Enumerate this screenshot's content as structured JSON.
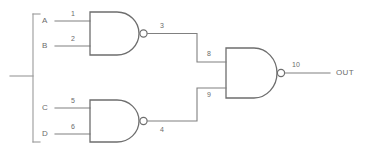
{
  "diagram": {
    "style": {
      "background": "#ffffff",
      "wire_color": "#808080",
      "gate_outline_color": "#6e6e6e",
      "text_color": "#6b6b6b"
    },
    "inputs": [
      {
        "name": "A",
        "label": "A",
        "wire_number": "1",
        "x": 45,
        "y": 21
      },
      {
        "name": "B",
        "label": "B",
        "wire_number": "2",
        "x": 45,
        "y": 46
      },
      {
        "name": "C",
        "label": "C",
        "wire_number": "5",
        "x": 45,
        "y": 108
      },
      {
        "name": "D",
        "label": "D",
        "wire_number": "6",
        "x": 45,
        "y": 134
      }
    ],
    "wire_numbers": {
      "a_input": "1",
      "b_input": "2",
      "gate1_output": "3",
      "gate2_output": "4",
      "c_input": "5",
      "d_input": "6",
      "gate3_input_top": "8",
      "gate3_input_bottom": "9",
      "gate3_output": "10"
    },
    "gates": [
      {
        "name": "gate-1",
        "type": "NAND",
        "inputs": [
          "1",
          "2"
        ],
        "output": "3"
      },
      {
        "name": "gate-2",
        "type": "NAND",
        "inputs": [
          "5",
          "6"
        ],
        "output": "4"
      },
      {
        "name": "gate-3",
        "type": "NAND",
        "inputs": [
          "8",
          "9"
        ],
        "output": "10"
      }
    ],
    "output": {
      "label": "OUT",
      "wire_number": "10"
    }
  }
}
